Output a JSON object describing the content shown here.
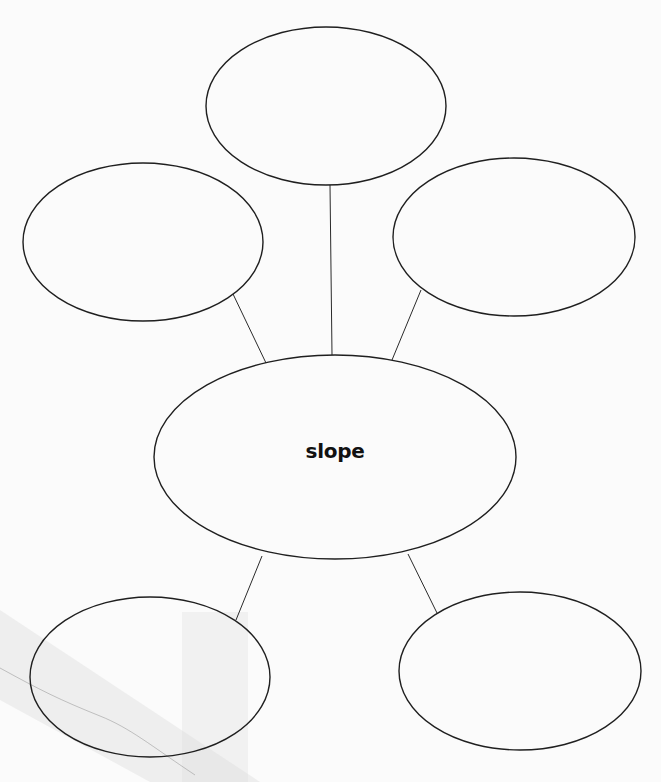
{
  "diagram": {
    "type": "concept-web",
    "center_node": {
      "label": "slope",
      "cx": 335,
      "cy": 457,
      "rx": 181,
      "ry": 102
    },
    "outer_nodes": [
      {
        "id": "top",
        "label": "",
        "cx": 326,
        "cy": 106,
        "rx": 120,
        "ry": 79
      },
      {
        "id": "upper-left",
        "label": "",
        "cx": 143,
        "cy": 242,
        "rx": 120,
        "ry": 79
      },
      {
        "id": "upper-right",
        "label": "",
        "cx": 514,
        "cy": 237,
        "rx": 121,
        "ry": 79
      },
      {
        "id": "lower-left",
        "label": "",
        "cx": 150,
        "cy": 677,
        "rx": 120,
        "ry": 80
      },
      {
        "id": "lower-right",
        "label": "",
        "cx": 520,
        "cy": 671,
        "rx": 121,
        "ry": 79
      }
    ],
    "connectors": [
      {
        "to": "top",
        "x1": 332,
        "y1": 355,
        "x2": 330,
        "y2": 185
      },
      {
        "to": "upper-left",
        "x1": 266,
        "y1": 363,
        "x2": 233,
        "y2": 294
      },
      {
        "to": "upper-right",
        "x1": 392,
        "y1": 360,
        "x2": 421,
        "y2": 290
      },
      {
        "to": "lower-left",
        "x1": 262,
        "y1": 556,
        "x2": 236,
        "y2": 620
      },
      {
        "to": "lower-right",
        "x1": 408,
        "y1": 554,
        "x2": 437,
        "y2": 613
      }
    ],
    "colors": {
      "background": "#fbfbfb",
      "stroke": "#1f1f1f",
      "text": "#111111"
    }
  }
}
